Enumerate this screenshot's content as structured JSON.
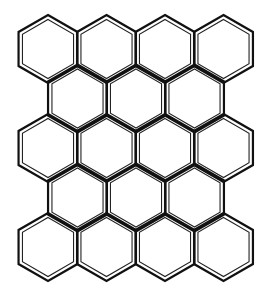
{
  "figure": {
    "title": "",
    "background_color": "#ffffff",
    "stroke_color": "#111111",
    "shape": "hexagon",
    "orientation": "pointy-top",
    "hex_radius": 34,
    "inner_radius": 29.5,
    "rows": [
      {
        "center_y": 49,
        "centers_x": [
          48,
          106.5,
          165,
          223.5
        ]
      },
      {
        "center_y": 98.5,
        "centers_x": [
          77.5,
          136,
          194.5
        ]
      },
      {
        "center_y": 148,
        "centers_x": [
          48,
          106.5,
          165,
          223.5
        ]
      },
      {
        "center_y": 197.5,
        "centers_x": [
          77.5,
          136,
          194.5
        ]
      },
      {
        "center_y": 247,
        "centers_x": [
          48,
          106.5,
          165,
          223.5
        ]
      }
    ],
    "hex_count": 18
  }
}
